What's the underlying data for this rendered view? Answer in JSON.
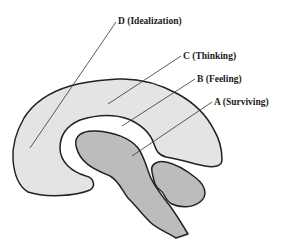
{
  "diagram": {
    "type": "brain-sagittal-section",
    "colors": {
      "outline": "#222222",
      "cortex_fill": "#e4e4e4",
      "core_fill": "#bcbcbc",
      "background": "#ffffff",
      "leader_line": "#333333"
    },
    "labels": [
      {
        "id": "D",
        "text": "D (Idealization)",
        "x": 118,
        "y": 17
      },
      {
        "id": "C",
        "text": "C (Thinking)",
        "x": 183,
        "y": 52
      },
      {
        "id": "B",
        "text": "B (Feeling)",
        "x": 197,
        "y": 75
      },
      {
        "id": "A",
        "text": "A (Surviving)",
        "x": 214,
        "y": 98
      }
    ]
  }
}
